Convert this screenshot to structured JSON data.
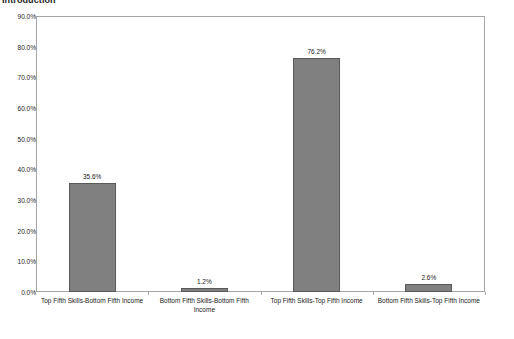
{
  "document": {
    "heading": "Introduction"
  },
  "chart_data": {
    "type": "bar",
    "title": "",
    "xlabel": "",
    "ylabel": "",
    "ylim": [
      0,
      90
    ],
    "grid": false,
    "legend": false,
    "y_ticks": [
      "0.0%",
      "10.0%",
      "20.0%",
      "30.0%",
      "40.0%",
      "50.0%",
      "60.0%",
      "70.0%",
      "80.0%",
      "90.0%"
    ],
    "y_tick_values": [
      0,
      10,
      20,
      30,
      40,
      50,
      60,
      70,
      80,
      90
    ],
    "categories": [
      "Top Fifth Skills-Bottom Fifth Income",
      "Bottom Fifth Skills-Bottom Fifth Income",
      "Top Fifth Skills-Top Fifth Income",
      "Bottom Fifth Skills-Top Fifth Income"
    ],
    "values": [
      35.6,
      1.2,
      76.2,
      2.6
    ],
    "data_labels": [
      "35.6%",
      "1.2%",
      "76.2%",
      "2.6%"
    ],
    "bar_color": "#808080",
    "bar_border_color": "#595959",
    "plot_border_color": "#a6a6a6"
  }
}
